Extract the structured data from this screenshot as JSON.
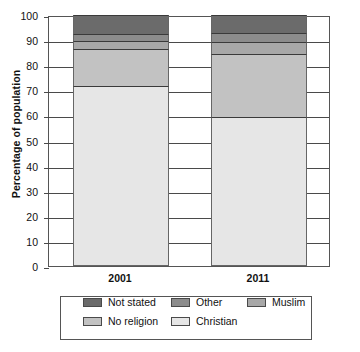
{
  "chart_data": {
    "type": "bar",
    "subtype": "stacked-bar-100",
    "title": "",
    "xlabel": "",
    "ylabel": "Percentage of population",
    "ylim": [
      0,
      100
    ],
    "yticks": [
      0,
      10,
      20,
      30,
      40,
      50,
      60,
      70,
      80,
      90,
      100
    ],
    "ytick_labels": [
      "0",
      "10",
      "20",
      "30",
      "40",
      "50",
      "60",
      "70",
      "80",
      "90",
      "100"
    ],
    "grid": true,
    "legend_position": "bottom",
    "categories": [
      "2001",
      "2011"
    ],
    "stack_order_bottom_to_top": [
      "Christian",
      "No religion",
      "Muslim",
      "Other",
      "Not stated"
    ],
    "series": [
      {
        "name": "Christian",
        "values": [
          71.7,
          59.3
        ],
        "color": "#e6e6e6"
      },
      {
        "name": "No religion",
        "values": [
          14.8,
          25.1
        ],
        "color": "#c2c2c2"
      },
      {
        "name": "Muslim",
        "values": [
          3.0,
          4.8
        ],
        "color": "#a8a8a8"
      },
      {
        "name": "Other",
        "values": [
          3.0,
          3.7
        ],
        "color": "#8c8c8c"
      },
      {
        "name": "Not stated",
        "values": [
          7.5,
          7.1
        ],
        "color": "#6b6b6b"
      }
    ],
    "legend": [
      {
        "label": "Not stated",
        "color": "#6b6b6b"
      },
      {
        "label": "Other",
        "color": "#8c8c8c"
      },
      {
        "label": "Muslim",
        "color": "#a8a8a8"
      },
      {
        "label": "No religion",
        "color": "#c2c2c2"
      },
      {
        "label": "Christian",
        "color": "#e6e6e6"
      }
    ]
  }
}
